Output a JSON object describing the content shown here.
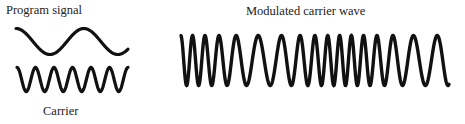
{
  "labels": {
    "program_signal": "Program signal",
    "carrier": "Carrier",
    "modulated": "Modulated carrier wave"
  },
  "waves": {
    "program": {
      "x0": 16,
      "x1": 128,
      "yc": 41.5,
      "amp": 13,
      "cycles": 1.65,
      "phase": 1.5708
    },
    "carrier": {
      "x0": 17,
      "x1": 128,
      "yc": 79.5,
      "amp": 12,
      "cycles": 6.0,
      "phase": 1.5708
    },
    "modulated": {
      "x0": 181,
      "x1": 449,
      "yc": 60.5,
      "amp": 25,
      "cycles": 17,
      "mod_depth": 0.35,
      "mod_cycles": 1.65
    },
    "stroke_color": "#111111"
  }
}
